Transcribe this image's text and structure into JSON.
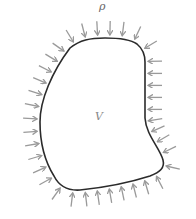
{
  "figure": {
    "pressure_label": "ρ",
    "volume_label": "V",
    "colors": {
      "boundary": "#2b2b2b",
      "arrows": "#9a9a9a",
      "background": "#ffffff"
    },
    "boundary_path": "M 70 48 C 80 40, 90 38, 105 38 C 120 38, 130 39, 137 44 C 143 49, 145 54, 145 62 L 145 118 C 146 135, 160 148, 163 160 C 165 168, 160 172, 150 176 C 125 184, 100 188, 80 190 C 65 191, 58 184, 54 176 C 44 160, 40 140, 40 122 C 40 100, 52 72, 70 48 Z",
    "arrow_count": 38
  }
}
